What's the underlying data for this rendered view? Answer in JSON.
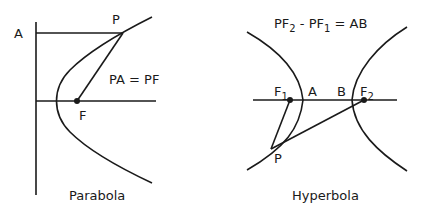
{
  "parabola": {
    "caption": "Parabola",
    "equation": "PA = PF",
    "points": {
      "A": "A",
      "P": "P",
      "F": "F"
    }
  },
  "hyperbola": {
    "caption": "Hyperbola",
    "equation": {
      "part1": "PF",
      "sub1": "2",
      "part2": " - PF",
      "sub2": "1",
      "part3": " = AB"
    },
    "points": {
      "F1": "F",
      "F1_sub": "1",
      "F2": "F",
      "F2_sub": "2",
      "A": "A",
      "B": "B",
      "P": "P"
    }
  }
}
